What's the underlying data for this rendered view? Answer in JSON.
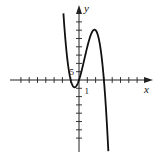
{
  "chart_data": {
    "type": "line",
    "title": "",
    "xlabel": "x",
    "ylabel": "y",
    "x_tick_step": 1,
    "y_tick_step": 5,
    "x_tick_label": "1",
    "y_tick_label": "5",
    "xlim": [
      -8,
      8.7
    ],
    "ylim": [
      -40,
      44
    ],
    "x_ticks": [
      -7,
      -6,
      -5,
      -4,
      -3,
      -2,
      -1,
      1,
      2,
      3,
      4,
      5,
      6,
      7
    ],
    "y_ticks": [
      -35,
      -30,
      -25,
      -20,
      -15,
      -10,
      -5,
      5,
      10,
      15,
      20,
      25,
      30,
      35
    ],
    "grid": false,
    "legend": null,
    "series": [
      {
        "name": "f(x)",
        "description": "cubic with zeros near x=-1, 0, 3; local min ≈(-0.5,-4.4), local max ≈(2,30)",
        "coeffs_descending": [
          -5,
          10,
          15,
          0
        ],
        "x_range": [
          -1.95,
          3.9
        ],
        "points": [
          {
            "x": -1.9,
            "y": 43.4
          },
          {
            "x": -1.5,
            "y": 16.9
          },
          {
            "x": -1.0,
            "y": 0
          },
          {
            "x": -0.5,
            "y": -4.4
          },
          {
            "x": 0,
            "y": 0
          },
          {
            "x": 0.5,
            "y": 9.4
          },
          {
            "x": 1.0,
            "y": 20
          },
          {
            "x": 1.5,
            "y": 28.1
          },
          {
            "x": 2.0,
            "y": 30
          },
          {
            "x": 2.5,
            "y": 21.9
          },
          {
            "x": 3.0,
            "y": 0
          },
          {
            "x": 3.5,
            "y": -39.4
          }
        ]
      }
    ]
  },
  "axes": {
    "x_label": "x",
    "y_label": "y",
    "x_unit_label": "1",
    "y_unit_label": "5"
  },
  "colors": {
    "curve": "#111111",
    "axes": "#222222",
    "background": "#ffffff"
  }
}
